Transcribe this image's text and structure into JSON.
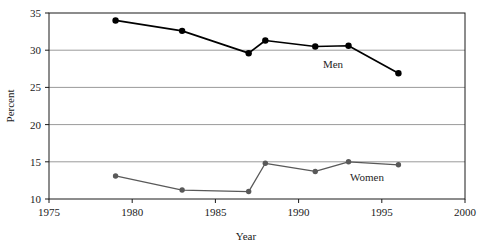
{
  "chart_data": {
    "type": "line",
    "title": "",
    "xlabel": "Year",
    "ylabel": "Percent",
    "xlim": [
      1975,
      2000
    ],
    "ylim": [
      10,
      35
    ],
    "xticks": [
      1975,
      1980,
      1985,
      1990,
      1995,
      2000
    ],
    "yticks": [
      10,
      15,
      20,
      25,
      30,
      35
    ],
    "grid": true,
    "grid_axis": "y",
    "legend": "inline-labels",
    "series": [
      {
        "name": "Men",
        "color": "#000000",
        "label_text": "Men",
        "x": [
          1979,
          1983,
          1987,
          1988,
          1991,
          1993,
          1996
        ],
        "values": [
          34.0,
          32.6,
          29.6,
          31.3,
          30.5,
          30.6,
          26.9
        ]
      },
      {
        "name": "Women",
        "color": "#595959",
        "label_text": "Women",
        "x": [
          1979,
          1983,
          1987,
          1988,
          1991,
          1993,
          1996
        ],
        "values": [
          13.1,
          11.2,
          11.0,
          14.8,
          13.7,
          15.0,
          14.6
        ]
      }
    ]
  },
  "axes": {
    "x_tick_labels": [
      "1975",
      "1980",
      "1985",
      "1990",
      "1995",
      "2000"
    ],
    "y_tick_labels": [
      "10",
      "15",
      "20",
      "25",
      "30",
      "35"
    ],
    "x_axis_title": "Year",
    "y_axis_title": "Percent"
  },
  "annotations": {
    "men_label": "Men",
    "women_label": "Women"
  },
  "colors": {
    "men_series": "#000000",
    "women_series": "#595959",
    "frame": "#1a1a1a",
    "gridline": "#9a9a9a",
    "background": "#ffffff"
  }
}
